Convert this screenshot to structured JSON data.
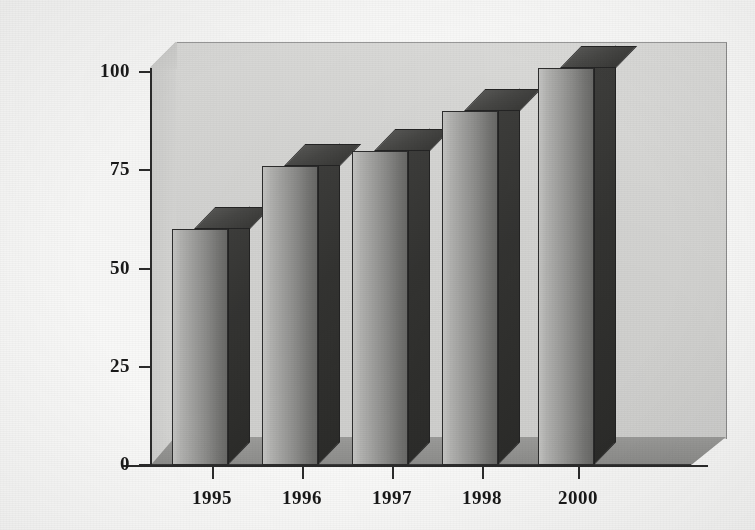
{
  "chart_data": {
    "type": "bar",
    "title": "",
    "subtitle": "",
    "xlabel": "",
    "ylabel": "USD billions",
    "categories": [
      "1995",
      "1996",
      "1997",
      "1998",
      "2000"
    ],
    "values": [
      60,
      76,
      80,
      90,
      101
    ],
    "series": [
      {
        "name": "USD billions",
        "values": [
          60,
          76,
          80,
          90,
          101
        ]
      }
    ],
    "ylim": [
      0,
      100
    ],
    "y_ticks": [
      0,
      25,
      50,
      75,
      100
    ],
    "y_tick_labels": [
      "0",
      "25",
      "50",
      "75",
      "100"
    ],
    "x_tick_labels": [
      "1995",
      "1996",
      "1997",
      "1998",
      "2000"
    ],
    "grid": false,
    "legend": false,
    "legend_position": "none",
    "style": "3d-column",
    "annotations": [],
    "colors": {
      "bar_face_light": "#c6c6c4",
      "bar_face_dark": "#6a6a68",
      "bar_side": "#343432",
      "bar_top": "#474745",
      "bar_outline": "#2d2d2d",
      "back_wall": "#d6d6d4",
      "floor": "#949492",
      "axis": "#2b2b2b",
      "text": "#191919",
      "background": "#fbfbfa"
    }
  },
  "axes": {
    "y_title": "USD billions",
    "y_ticks": [
      {
        "label": "100",
        "value": 100
      },
      {
        "label": "75",
        "value": 75
      },
      {
        "label": "50",
        "value": 50
      },
      {
        "label": "25",
        "value": 25
      },
      {
        "label": "0",
        "value": 0
      }
    ],
    "x_ticks": [
      {
        "label": "1995"
      },
      {
        "label": "1996"
      },
      {
        "label": "1997"
      },
      {
        "label": "1998"
      },
      {
        "label": "2000"
      }
    ]
  },
  "bars": [
    {
      "category": "1995",
      "value": 60
    },
    {
      "category": "1996",
      "value": 76
    },
    {
      "category": "1997",
      "value": 80
    },
    {
      "category": "1998",
      "value": 90
    },
    {
      "category": "2000",
      "value": 101
    }
  ]
}
